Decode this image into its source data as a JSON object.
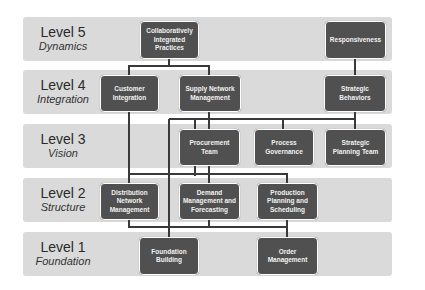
{
  "levels": [
    {
      "title": "Level 5",
      "subtitle": "Dynamics"
    },
    {
      "title": "Level 4",
      "subtitle": "Integration"
    },
    {
      "title": "Level 3",
      "subtitle": "Vision"
    },
    {
      "title": "Level 2",
      "subtitle": "Structure"
    },
    {
      "title": "Level 1",
      "subtitle": "Foundation"
    }
  ],
  "boxes": {
    "collaboratively_integrated_practices": "Collaboratively Integrated Practices",
    "responsiveness": "Responsiveness",
    "customer_integration": "Customer Integration",
    "supply_network_management": "Supply Network Management",
    "strategic_behaviors": "Strategic Behaviors",
    "procurement_team": "Procurement Team",
    "process_governance": "Process Governance",
    "strategic_planning_team": "Strategic Planning Team",
    "distribution_network_management": "Distribution Network Management",
    "demand_management_forecasting": "Demand Management and Forecasting",
    "production_planning_scheduling": "Production Planning and Scheduling",
    "foundation_building": "Foundation Building",
    "order_management": "Order Management"
  },
  "colors": {
    "band": "#dadada",
    "box": "#505050",
    "connector": "#3a3a3a"
  }
}
